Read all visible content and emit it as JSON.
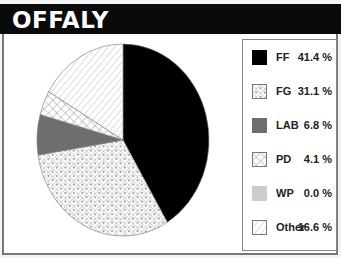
{
  "header": {
    "title": "OFFALY"
  },
  "colors": {
    "FF": "#000000",
    "LAB": "#6e6e6e",
    "WP": "#cccccc",
    "border": "#777777"
  },
  "legend": {
    "items": [
      {
        "label": "FF",
        "value": "41.4 %"
      },
      {
        "label": "FG",
        "value": "31.1 %"
      },
      {
        "label": "LAB",
        "value": "6.8 %"
      },
      {
        "label": "PD",
        "value": "4.1 %"
      },
      {
        "label": "WP",
        "value": "0.0 %"
      },
      {
        "label": "Other",
        "value": "16.6 %"
      }
    ]
  },
  "chart_data": {
    "type": "pie",
    "title": "OFFALY",
    "categories": [
      "FF",
      "FG",
      "LAB",
      "PD",
      "WP",
      "Other"
    ],
    "values": [
      41.4,
      31.1,
      6.8,
      4.1,
      0.0,
      16.6
    ],
    "unit": "%",
    "fills": {
      "FF": "solid black",
      "FG": "crosshatch with dots",
      "LAB": "solid dark gray",
      "PD": "crosshatch",
      "WP": "solid light gray",
      "Other": "diagonal hatch"
    },
    "legend_position": "right",
    "start_angle": "12 o'clock, clockwise"
  }
}
